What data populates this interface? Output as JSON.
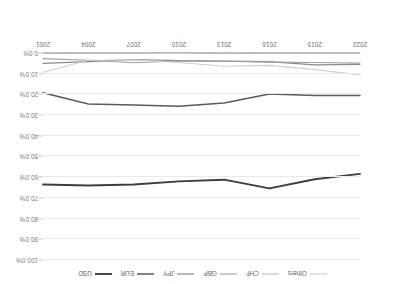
{
  "chart_data": {
    "type": "line",
    "title": "",
    "xlabel": "",
    "ylabel": "",
    "ylim": [
      0,
      100
    ],
    "ytick_labels": [
      "0.0%",
      "10.0%",
      "20.0%",
      "30.0%",
      "40.0%",
      "50.0%",
      "60.0%",
      "70.0%",
      "80.0%",
      "90.0%",
      "100.0%"
    ],
    "ytick_values": [
      0,
      10,
      20,
      30,
      40,
      50,
      60,
      70,
      80,
      90,
      100
    ],
    "grid": true,
    "legend_position": "top",
    "orientation_note": "rendered rotated 180 degrees",
    "categories": [
      "2001",
      "2004",
      "2007",
      "2010",
      "2013",
      "2016",
      "2019",
      "2022"
    ],
    "x_axis_display_order": [
      "2022",
      "2019",
      "2016",
      "2013",
      "2010",
      "2007",
      "2004",
      "2001"
    ],
    "series": [
      {
        "name": "USD",
        "color": "#3d3d3d",
        "width": 1.9,
        "values": [
          63.5,
          64.0,
          63.5,
          62.0,
          61.2,
          65.4,
          61.0,
          58.4
        ]
      },
      {
        "name": "EUR",
        "color": "#5a5a5a",
        "width": 1.5,
        "values": [
          19.2,
          24.6,
          25.1,
          25.7,
          24.2,
          19.8,
          20.5,
          20.5
        ]
      },
      {
        "name": "JPY",
        "color": "#8a8a8a",
        "width": 1.2,
        "values": [
          5.0,
          4.2,
          3.2,
          3.7,
          3.9,
          4.2,
          5.7,
          5.5
        ]
      },
      {
        "name": "GBP",
        "color": "#a0a0a0",
        "width": 1.1,
        "values": [
          2.7,
          3.5,
          4.7,
          3.9,
          4.0,
          4.4,
          4.6,
          4.9
        ]
      },
      {
        "name": "CHF",
        "color": "#b8b8b8",
        "width": 1.0,
        "values": [
          0.3,
          0.2,
          0.2,
          0.1,
          0.3,
          0.2,
          0.2,
          0.2
        ]
      },
      {
        "name": "Others",
        "color": "#cfcfcf",
        "width": 1.2,
        "values": [
          9.3,
          3.5,
          3.3,
          4.6,
          6.4,
          6.0,
          8.0,
          10.5
        ]
      }
    ]
  },
  "legend": {
    "items": [
      {
        "label": "USD"
      },
      {
        "label": "EUR"
      },
      {
        "label": "JPY"
      },
      {
        "label": "GBP"
      },
      {
        "label": "CHF"
      },
      {
        "label": "Others"
      }
    ]
  }
}
